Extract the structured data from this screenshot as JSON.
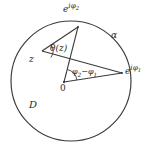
{
  "figure": {
    "kind": "unit-disk-geometry-diagram",
    "background_color": "#ffffff",
    "stroke_color": "#3a3a3a",
    "text_color": "#2b2b2b"
  },
  "labels": {
    "boundary_point_upper": {
      "base": "e",
      "exponent_i": "i",
      "exponent_phi": "φ",
      "exponent_index": "2",
      "text": "e^{iφ₂}"
    },
    "boundary_point_right": {
      "base": "e",
      "exponent_i": "i",
      "exponent_phi": "φ",
      "exponent_index": "1",
      "text": "e^{iφ₁}"
    },
    "arc": "α",
    "inscribed_angle": "θ(z)",
    "interior_point": "z",
    "central_angle": "φ₂ − φ₁",
    "central_angle_parts": {
      "phi": "φ",
      "index_2": "2",
      "minus": "−",
      "index_1": "1"
    },
    "origin": "0",
    "domain": "D"
  },
  "geometry": {
    "circle": {
      "cx": 71,
      "cy": 81,
      "r": 60
    },
    "points": {
      "origin": {
        "x": 64,
        "y": 82
      },
      "z": {
        "x": 42,
        "y": 51
      },
      "e_i_phi_2": {
        "x": 78,
        "y": 27
      },
      "e_i_phi_1": {
        "x": 122,
        "y": 73
      }
    },
    "segments": [
      {
        "name": "z-to-e2",
        "from": "z",
        "to": "e_i_phi_2"
      },
      {
        "name": "z-to-e1",
        "from": "z",
        "to": "e_i_phi_1"
      },
      {
        "name": "origin-to-e2",
        "from": "origin",
        "to": "e_i_phi_2"
      },
      {
        "name": "origin-to-e1",
        "from": "origin",
        "to": "e_i_phi_1"
      }
    ],
    "angle_arcs": [
      {
        "name": "theta-at-z",
        "vertex": "z",
        "radius": 11
      },
      {
        "name": "central-at-origin",
        "vertex": "origin",
        "radius": 13
      }
    ]
  }
}
